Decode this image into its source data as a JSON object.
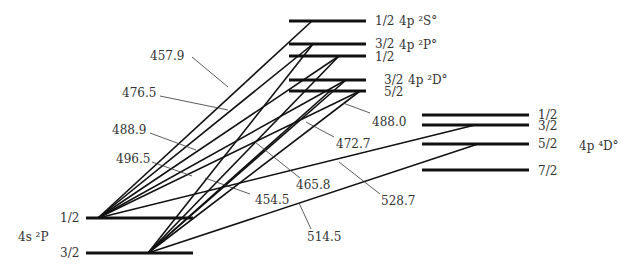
{
  "terms": [
    {
      "id": "S",
      "name": "4p ²S°",
      "label_x": 399,
      "label_y": 25,
      "levels": [
        {
          "j": "1/2",
          "y": 21,
          "x1": 289,
          "x2": 366,
          "jx": 375,
          "jy": 25
        }
      ]
    },
    {
      "id": "P",
      "name": "4p ²P°",
      "label_x": 399,
      "label_y": 49,
      "levels": [
        {
          "j": "3/2",
          "y": 44,
          "x1": 289,
          "x2": 366,
          "jx": 375,
          "jy": 48
        },
        {
          "j": "1/2",
          "y": 56,
          "x1": 289,
          "x2": 366,
          "jx": 375,
          "jy": 61
        }
      ]
    },
    {
      "id": "D",
      "name": "4p ²D°",
      "label_x": 408,
      "label_y": 84,
      "levels": [
        {
          "j": "3/2",
          "y": 80,
          "x1": 289,
          "x2": 366,
          "jx": 384,
          "jy": 84
        },
        {
          "j": "5/2",
          "y": 91,
          "x1": 289,
          "x2": 366,
          "jx": 384,
          "jy": 96
        }
      ]
    },
    {
      "id": "Q",
      "name": "4p ⁴D°",
      "label_x": 579,
      "label_y": 150,
      "levels": [
        {
          "j": "1/2",
          "y": 115,
          "x1": 422,
          "x2": 529,
          "jx": 538,
          "jy": 119
        },
        {
          "j": "3/2",
          "y": 125,
          "x1": 422,
          "x2": 529,
          "jx": 538,
          "jy": 130
        },
        {
          "j": "5/2",
          "y": 144,
          "x1": 422,
          "x2": 529,
          "jx": 538,
          "jy": 148
        },
        {
          "j": "7/2",
          "y": 170,
          "x1": 422,
          "x2": 529,
          "jx": 538,
          "jy": 175
        }
      ]
    },
    {
      "id": "G",
      "name": "4s ²P",
      "label_x": 18,
      "label_y": 241,
      "levels": [
        {
          "j": "1/2",
          "y": 218,
          "x1": 86,
          "x2": 193,
          "jx": 60,
          "jy": 222
        },
        {
          "j": "3/2",
          "y": 253,
          "x1": 86,
          "x2": 193,
          "jx": 60,
          "jy": 257
        }
      ]
    }
  ],
  "transitions": [
    {
      "from": [
        98,
        218
      ],
      "to": [
        312,
        21
      ]
    },
    {
      "from": [
        98,
        218
      ],
      "to": [
        339,
        56
      ]
    },
    {
      "from": [
        98,
        218
      ],
      "to": [
        346,
        80
      ]
    },
    {
      "from": [
        98,
        218
      ],
      "to": [
        313,
        44
      ]
    },
    {
      "from": [
        98,
        218
      ],
      "to": [
        360,
        91
      ]
    },
    {
      "from": [
        98,
        218
      ],
      "to": [
        475,
        125
      ]
    },
    {
      "from": [
        148,
        253
      ],
      "to": [
        313,
        44
      ]
    },
    {
      "from": [
        148,
        253
      ],
      "to": [
        339,
        56
      ]
    },
    {
      "from": [
        148,
        253
      ],
      "to": [
        346,
        80
      ]
    },
    {
      "from": [
        148,
        253
      ],
      "to": [
        330,
        91
      ]
    },
    {
      "from": [
        148,
        253
      ],
      "to": [
        360,
        91
      ]
    },
    {
      "from": [
        148,
        253
      ],
      "to": [
        478,
        144
      ]
    }
  ],
  "wavelengths": [
    {
      "text": "457.9",
      "x": 150,
      "y": 60,
      "lx1": 192,
      "ly1": 57,
      "lx2": 228,
      "ly2": 87
    },
    {
      "text": "476.5",
      "x": 122,
      "y": 97,
      "lx1": 160,
      "ly1": 96,
      "lx2": 228,
      "ly2": 110
    },
    {
      "text": "488.9",
      "x": 112,
      "y": 134,
      "lx1": 150,
      "ly1": 133,
      "lx2": 196,
      "ly2": 150
    },
    {
      "text": "496.5",
      "x": 116,
      "y": 163,
      "lx1": 152,
      "ly1": 162,
      "lx2": 192,
      "ly2": 176
    },
    {
      "text": "454.5",
      "x": 255,
      "y": 204,
      "lx1": 250,
      "ly1": 194,
      "lx2": 205,
      "ly2": 178
    },
    {
      "text": "465.8",
      "x": 296,
      "y": 189,
      "lx1": 300,
      "ly1": 178,
      "lx2": 255,
      "ly2": 142
    },
    {
      "text": "472.7",
      "x": 336,
      "y": 148,
      "lx1": 334,
      "ly1": 137,
      "lx2": 306,
      "ly2": 122
    },
    {
      "text": "488.0",
      "x": 372,
      "y": 126,
      "lx1": 370,
      "ly1": 113,
      "lx2": 343,
      "ly2": 103
    },
    {
      "text": "528.7",
      "x": 381,
      "y": 205,
      "lx1": 380,
      "ly1": 194,
      "lx2": 339,
      "ly2": 162
    },
    {
      "text": "514.5",
      "x": 307,
      "y": 241,
      "lx1": 311,
      "ly1": 229,
      "lx2": 299,
      "ly2": 203
    }
  ]
}
